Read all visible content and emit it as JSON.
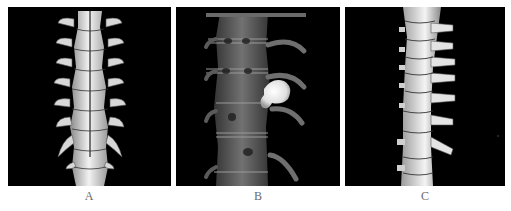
{
  "figure": {
    "panels": [
      {
        "id": "A",
        "label": "A",
        "content": "3D CT volume rendering of thoracic spine, posterior view (bone surface rendering)",
        "background_color": "#000000",
        "bone_color": "#e6e6e6"
      },
      {
        "id": "B",
        "label": "B",
        "content": "3D CT translucent volume rendering of thoracic spine with bright lobulated calcified lesion adjacent to right side of vertebral body",
        "background_color": "#000000",
        "bone_color": "#7a7a7a",
        "lesion_color": "#f0f0f0"
      },
      {
        "id": "C",
        "label": "C",
        "content": "3D CT volume rendering of thoracic spine, oblique lateral view",
        "background_color": "#000000",
        "bone_color": "#e6e6e6"
      }
    ]
  }
}
